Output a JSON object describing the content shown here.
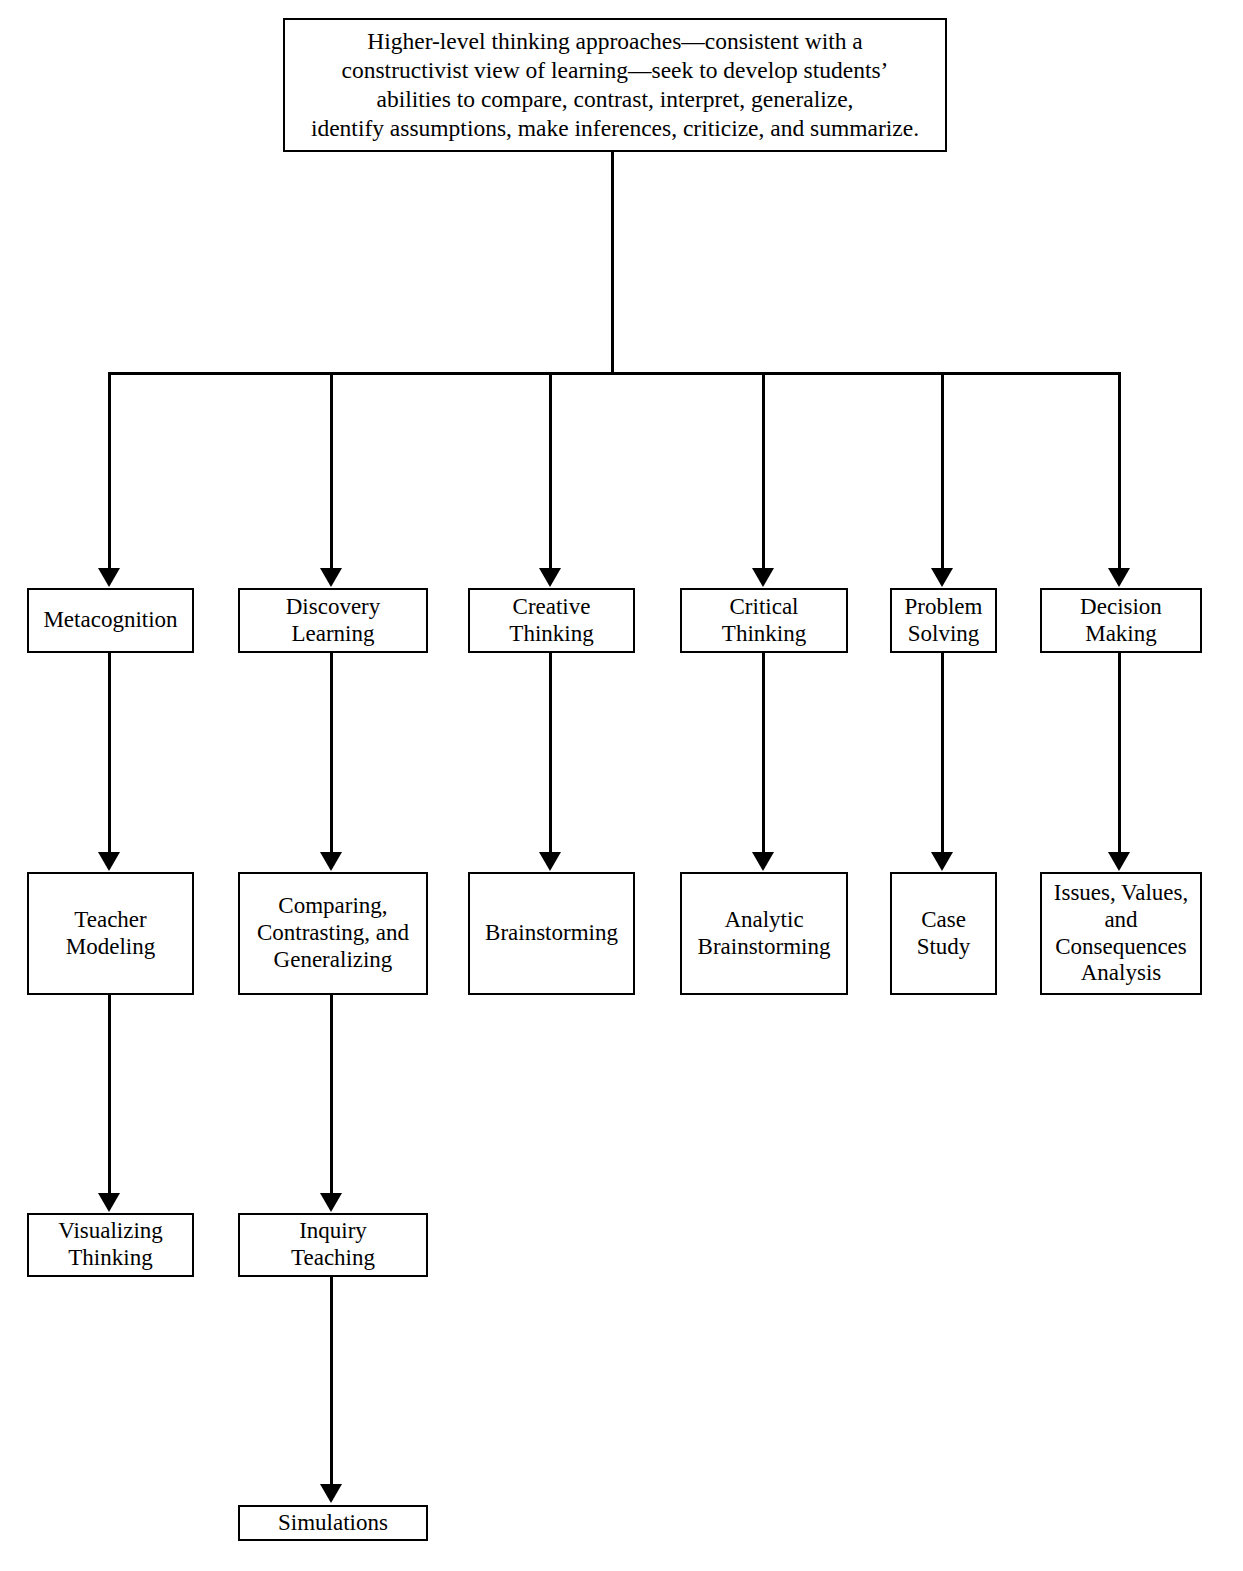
{
  "diagram": {
    "title": "Higher-level thinking approaches",
    "root": {
      "id": "root",
      "text": "Higher-level thinking approaches—consistent with a\nconstructivist view of learning—seek to develop students’\nabilities to compare, contrast, interpret, generalize,\nidentify assumptions, make inferences, criticize, and summarize."
    },
    "columns": [
      {
        "id": "metacognition",
        "level1": "Metacognition",
        "level2": "Teacher\nModeling",
        "level3": "Visualizing\nThinking",
        "level4": null
      },
      {
        "id": "discovery-learning",
        "level1": "Discovery\nLearning",
        "level2": "Comparing,\nContrasting, and\nGeneralizing",
        "level3": "Inquiry\nTeaching",
        "level4": "Simulations"
      },
      {
        "id": "creative-thinking",
        "level1": "Creative\nThinking",
        "level2": "Brainstorming",
        "level3": null,
        "level4": null
      },
      {
        "id": "critical-thinking",
        "level1": "Critical\nThinking",
        "level2": "Analytic\nBrainstorming",
        "level3": null,
        "level4": null
      },
      {
        "id": "problem-solving",
        "level1": "Problem\nSolving",
        "level2": "Case\nStudy",
        "level3": null,
        "level4": null
      },
      {
        "id": "decision-making",
        "level1": "Decision\nMaking",
        "level2": "Issues, Values,\nand\nConsequences\nAnalysis",
        "level3": null,
        "level4": null
      }
    ],
    "colors": {
      "background": "#ffffff",
      "stroke": "#000000",
      "text": "#000000"
    }
  }
}
